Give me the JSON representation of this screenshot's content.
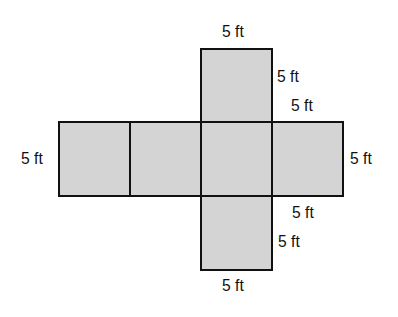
{
  "diagram": {
    "fill_color": "#d4d4d4",
    "stroke_color": "#111111",
    "faces": [
      {
        "id": "top",
        "x": 200,
        "y": 48,
        "w": 73,
        "h": 75
      },
      {
        "id": "row-1",
        "x": 58,
        "y": 121,
        "w": 73,
        "h": 76
      },
      {
        "id": "row-2",
        "x": 129,
        "y": 121,
        "w": 73,
        "h": 76
      },
      {
        "id": "row-3",
        "x": 200,
        "y": 121,
        "w": 73,
        "h": 76
      },
      {
        "id": "row-4",
        "x": 271,
        "y": 121,
        "w": 73,
        "h": 76
      },
      {
        "id": "bottom",
        "x": 200,
        "y": 195,
        "w": 73,
        "h": 76
      }
    ],
    "labels": {
      "top_width": "5 ft",
      "top_height": "5 ft",
      "right_top_width": "5 ft",
      "left_height": "5 ft",
      "right_height": "5 ft",
      "right_bottom_width": "5 ft",
      "bottom_height": "5 ft",
      "bottom_width": "5 ft"
    }
  }
}
